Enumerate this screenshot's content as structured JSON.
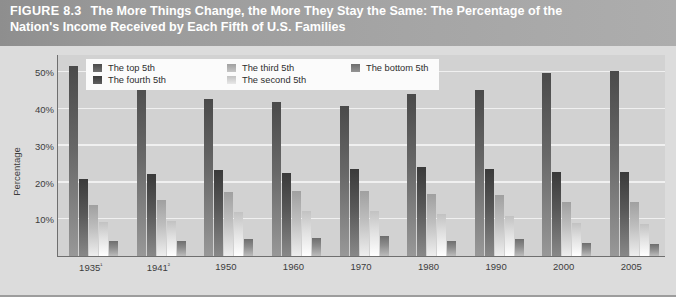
{
  "header": {
    "figure_label": "FIGURE 8.3",
    "title_line1": "The More Things Change, the More They Stay the Same: The Percentage of the",
    "title_line2": "Nation's Income Received by Each Fifth of U.S. Families"
  },
  "legend": {
    "items": [
      {
        "label": "The top 5th",
        "color": "#4a4a4a"
      },
      {
        "label": "The third 5th",
        "color": "#a0a0a0"
      },
      {
        "label": "The bottom 5th",
        "color": "#6e6e6e"
      },
      {
        "label": "The fourth 5th",
        "color": "#3a3a3a"
      },
      {
        "label": "The second 5th",
        "color": "#c2c2c2"
      }
    ]
  },
  "colors": {
    "panel_background": "#dcdcdc",
    "plot_background": "#d2d2d2",
    "gridline": "#f0f0f0",
    "axis": "#6f6f6f",
    "header_bar": "#9a9a9a",
    "header_text": "#ffffff",
    "tick_text": "#3c3c3c"
  },
  "chart_data": {
    "type": "bar",
    "title": "The More Things Change, the More They Stay the Same: The Percentage of the Nation's Income Received by Each Fifth of U.S. Families",
    "xlabel": "",
    "ylabel": "Percentage",
    "ylim": [
      0,
      55
    ],
    "yticks": [
      10,
      20,
      30,
      40,
      50
    ],
    "ytick_labels": [
      "10%",
      "20%",
      "30%",
      "40%",
      "50%"
    ],
    "grid": true,
    "legend_position": "top-left-inside",
    "categories": [
      "1935¹",
      "1941²",
      "1950",
      "1960",
      "1970",
      "1980",
      "1990",
      "2000",
      "2005"
    ],
    "category_plain": [
      "1935",
      "1941",
      "1950",
      "1960",
      "1970",
      "1980",
      "1990",
      "2000",
      "2005"
    ],
    "series": [
      {
        "name": "The top 5th",
        "color": "#4a4a4a",
        "values": [
          51.7,
          49.0,
          42.7,
          41.8,
          40.9,
          44.1,
          45.3,
          49.7,
          50.4
        ]
      },
      {
        "name": "The fourth 5th",
        "color": "#3a3a3a",
        "values": [
          20.9,
          22.3,
          23.5,
          22.6,
          23.8,
          24.2,
          23.8,
          23.0,
          23.0
        ]
      },
      {
        "name": "The third 5th",
        "color": "#a0a0a0",
        "values": [
          13.8,
          15.3,
          17.3,
          17.8,
          17.6,
          17.0,
          16.6,
          14.8,
          14.6
        ]
      },
      {
        "name": "The second 5th",
        "color": "#c2c2c2",
        "values": [
          9.2,
          9.5,
          12.0,
          12.2,
          12.2,
          11.5,
          10.8,
          9.0,
          8.6
        ]
      },
      {
        "name": "The bottom 5th",
        "color": "#6e6e6e",
        "values": [
          4.1,
          4.1,
          4.5,
          4.8,
          5.4,
          4.2,
          4.6,
          3.6,
          3.4
        ]
      }
    ]
  }
}
